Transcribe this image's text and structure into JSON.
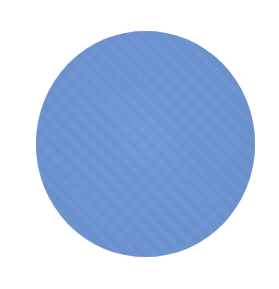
{
  "image": {
    "subject": "color-swatch",
    "shape": "circle",
    "texture": "woven fabric",
    "colors": {
      "swatch": "#6a93d2",
      "background": "#ffffff"
    }
  }
}
